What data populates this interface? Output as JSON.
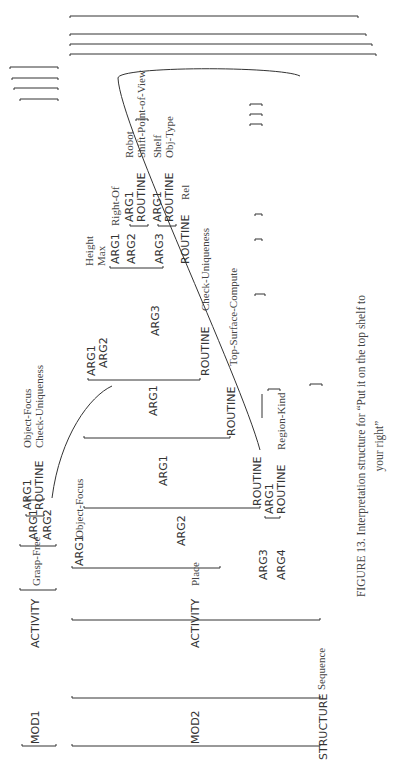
{
  "figure": {
    "caption_line1": "FIGURE 13.  Interpretation structure for “Put it on the top shelf to",
    "caption_line2": "your right”"
  },
  "mod1": {
    "label": "MOD1",
    "activity_key": "ACTIVITY",
    "activity_value": "Grasp-Free",
    "arg1_key": "ARG1",
    "arg1_inner": {
      "arg1_key": "ARG1",
      "arg1_value": "Object-Focus",
      "routine_key": "ROUTINE",
      "routine_value": "Check-Uniqueness"
    },
    "arg2_key": "ARG2"
  },
  "mod2": {
    "label": "MOD2",
    "activity_key": "ACTIVITY",
    "activity_value": "Place",
    "arg1_key": "ARG1",
    "arg1_value": "Object-Focus",
    "arg2_key": "ARG2",
    "arg2": {
      "arg1_key": "ARG1",
      "arg1": {
        "arg1_key": "ARG1",
        "arg1": {
          "arg1_key": "ARG1",
          "arg2_key": "ARG2",
          "arg3_key": "ARG3",
          "routine_key": "ROUTINE",
          "routine_value": "Check-Uniqueness",
          "arg3": {
            "arg1_key": "ARG1",
            "arg1_value_1": "Height",
            "arg1_value_2": "Max",
            "arg2_key": "ARG2",
            "arg2": {
              "right_of": "Right-Of",
              "arg1_key": "ARG1",
              "arg1_value": "Robot",
              "routine_key": "ROUTINE",
              "routine_value": "Shift-Point-of-View"
            },
            "arg3_key": "ARG3",
            "arg3": {
              "arg1_key": "ARG1",
              "arg1_value": "Shelf",
              "routine_key": "ROUTINE",
              "routine_value": "Obj-Type"
            },
            "routine_key": "ROUTINE",
            "routine_value": "Rel"
          },
          "select_routine_value": "Select-Prop-Max-Min"
        },
        "routine_key": "ROUTINE",
        "routine_value": "Top-Surface-Compute"
      },
      "routine_key": "ROUTINE"
    },
    "arg3_key": "ARG3",
    "arg4_key": "ARG4",
    "arg4": {
      "arg1_key": "ARG1",
      "routine_key": "ROUTINE",
      "routine_value": "Region-Kind"
    }
  },
  "structure": {
    "key": "STRUCTURE",
    "value": "Sequence"
  }
}
